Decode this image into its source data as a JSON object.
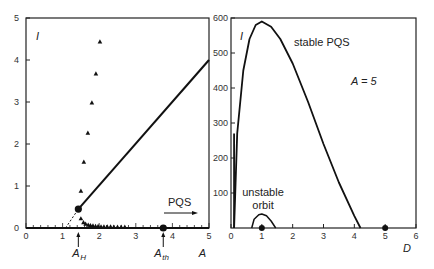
{
  "chart_data": [
    {
      "type": "line",
      "panel": "left",
      "xlabel": "A",
      "ylabel": "I",
      "xlim": [
        0,
        5
      ],
      "ylim": [
        0,
        5
      ],
      "xticks": [
        "0",
        "1",
        "2",
        "3",
        "4",
        "5"
      ],
      "yticks": [
        "0",
        "1",
        "2",
        "3",
        "4",
        "5"
      ],
      "grid": false,
      "series": [
        {
          "name": "stable branch (solid line)",
          "style": "solid",
          "x": [
            1.43,
            5.0
          ],
          "y": [
            0.45,
            4.0
          ]
        },
        {
          "name": "extrapolation (dashed)",
          "style": "dashed",
          "x": [
            1.08,
            1.43
          ],
          "y": [
            0.0,
            0.45
          ]
        },
        {
          "name": "triangles (upper)",
          "style": "marker-triangle",
          "x": [
            1.5,
            1.58,
            1.69,
            1.8,
            1.91,
            2.02
          ],
          "y": [
            0.88,
            1.57,
            2.26,
            2.98,
            3.67,
            4.43
          ]
        },
        {
          "name": "triangles (lower)",
          "style": "marker-triangle",
          "x": [
            1.5,
            1.57,
            1.63,
            1.7,
            1.76,
            1.83,
            1.9,
            1.97,
            2.05,
            2.13,
            2.22,
            2.31,
            2.4,
            2.5,
            2.6,
            2.7
          ],
          "y": [
            0.22,
            0.13,
            0.09,
            0.07,
            0.06,
            0.05,
            0.04,
            0.04,
            0.03,
            0.03,
            0.03,
            0.03,
            0.02,
            0.02,
            0.02,
            0.02
          ]
        },
        {
          "name": "zero line",
          "style": "solid",
          "x": [
            0,
            5
          ],
          "y": [
            0,
            0
          ]
        }
      ],
      "points": [
        {
          "name": "Hopf point",
          "x": 1.43,
          "y": 0.45
        },
        {
          "name": "threshold point",
          "x": 3.75,
          "y": 0.0
        }
      ],
      "annotations": [
        {
          "text": "A_H",
          "x": 1.43,
          "arrow": "up"
        },
        {
          "text": "A_th",
          "x": 3.75,
          "arrow": "up"
        },
        {
          "text": "PQS",
          "arrow": "right"
        }
      ]
    },
    {
      "type": "line",
      "panel": "right",
      "xlabel": "D",
      "ylabel": "I",
      "xlim": [
        0,
        6
      ],
      "ylim": [
        0,
        600
      ],
      "xticks": [
        "0",
        "1",
        "2",
        "3",
        "4",
        "5",
        "6"
      ],
      "yticks": [
        "100",
        "200",
        "300",
        "400",
        "500",
        "600"
      ],
      "grid": false,
      "series": [
        {
          "name": "stable PQS",
          "x": [
            0.1,
            0.2,
            0.4,
            0.6,
            0.8,
            1.0,
            1.3,
            1.6,
            2.0,
            2.5,
            3.0,
            3.5,
            4.0,
            4.2
          ],
          "y": [
            0,
            270,
            450,
            540,
            580,
            590,
            575,
            540,
            470,
            360,
            240,
            130,
            35,
            0
          ]
        },
        {
          "name": "unstable orbit",
          "x": [
            0.67,
            0.75,
            0.9,
            1.0,
            1.15,
            1.3,
            1.45
          ],
          "y": [
            0,
            25,
            38,
            40,
            35,
            20,
            0
          ]
        }
      ],
      "points": [
        {
          "x": 1.0,
          "y": 0
        },
        {
          "x": 5.0,
          "y": 0
        }
      ],
      "annotations": [
        {
          "text": "stable PQS"
        },
        {
          "text": "unstable"
        },
        {
          "text": "orbit"
        },
        {
          "text": "A = 5"
        }
      ]
    }
  ],
  "labels": {
    "left_ylabel": "I",
    "left_xlabel": "A",
    "right_ylabel": "I",
    "right_xlabel": "D",
    "ah": "A",
    "ah_sub": "H",
    "ath": "A",
    "ath_sub": "th",
    "pqs": "PQS",
    "stable_pqs": "stable PQS",
    "unstable": "unstable",
    "orbit": "orbit",
    "a_eq": "A = 5"
  }
}
